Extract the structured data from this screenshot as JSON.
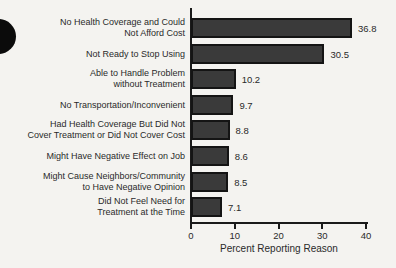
{
  "page": {
    "background_color": "#f4f3f0",
    "artifacts": [
      "hole-punch-mark-left-edge"
    ]
  },
  "chart_data": {
    "type": "bar",
    "orientation": "horizontal",
    "title": "",
    "categories": [
      "No Health Coverage and Could\nNot Afford Cost",
      "Not Ready to Stop Using",
      "Able to Handle Problem\nwithout Treatment",
      "No Transportation/Inconvenient",
      "Had Health Coverage But Did Not\nCover Treatment or Did Not Cover Cost",
      "Might Have Negative Effect on Job",
      "Might Cause Neighbors/Community\nto Have Negative Opinion",
      "Did Not Feel Need for\nTreatment at the Time"
    ],
    "values": [
      36.8,
      30.5,
      10.2,
      9.7,
      8.8,
      8.6,
      8.5,
      7.1
    ],
    "value_labels": [
      "36.8",
      "30.5",
      "10.2",
      "9.7",
      "8.8",
      "8.6",
      "8.5",
      "7.1"
    ],
    "xlabel": "Percent Reporting Reason",
    "ylabel": "",
    "xlim": [
      0,
      40
    ],
    "xticks": [
      0,
      10,
      20,
      30,
      40
    ],
    "xtick_labels": [
      "0",
      "10",
      "20",
      "30",
      "40"
    ],
    "grid": false,
    "legend": false,
    "bar_color": "#3a3a3a",
    "bar_border_color": "#141414",
    "axis_color": "#1a1a1a"
  }
}
